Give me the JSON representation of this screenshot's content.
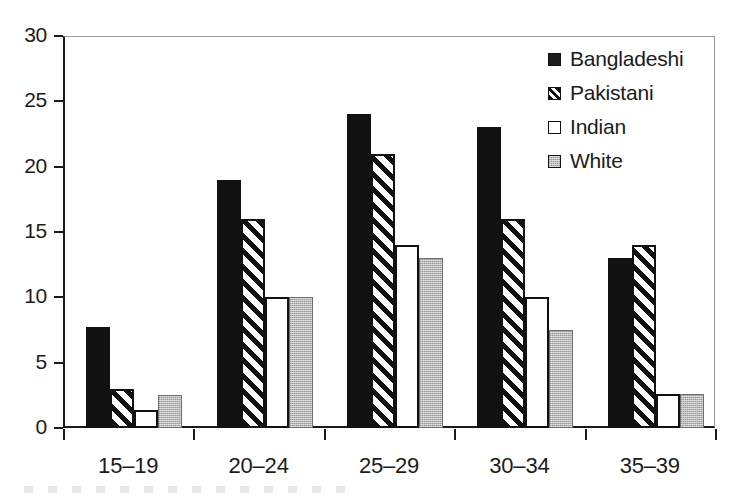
{
  "chart_data": {
    "type": "bar",
    "title": "",
    "subtitle": "",
    "xlabel": "",
    "ylabel": "",
    "categories": [
      "15–19",
      "20–24",
      "25–29",
      "30–34",
      "35–39"
    ],
    "series": [
      {
        "name": "Bangladeshi",
        "fill": "solid-black",
        "values": [
          7.7,
          19,
          24,
          23,
          13
        ]
      },
      {
        "name": "Pakistani",
        "fill": "diag-hatch",
        "values": [
          3.0,
          16,
          21,
          16,
          14
        ]
      },
      {
        "name": "Indian",
        "fill": "open-white",
        "values": [
          1.4,
          10,
          14,
          10,
          2.6
        ]
      },
      {
        "name": "White",
        "fill": "stipple-gray",
        "values": [
          2.5,
          10,
          13,
          7.5,
          2.6
        ]
      }
    ],
    "ylim": [
      0,
      30
    ],
    "ytick_values": [
      0,
      5,
      10,
      15,
      20,
      25,
      30
    ],
    "ytick_labels": [
      "0",
      "5",
      "10",
      "15",
      "20",
      "25",
      "30"
    ],
    "grid": false,
    "legend_position": "top-right-inside",
    "bar_orientation": "vertical",
    "group_gap": true,
    "annotations": []
  },
  "axes": {
    "y": {
      "ticks": [
        {
          "label": "30",
          "value": 30
        },
        {
          "label": "25",
          "value": 25
        },
        {
          "label": "20",
          "value": 20
        },
        {
          "label": "15",
          "value": 15
        },
        {
          "label": "10",
          "value": 10
        },
        {
          "label": "5",
          "value": 5
        },
        {
          "label": "0",
          "value": 0
        }
      ]
    },
    "x": {
      "ticks": [
        {
          "label": "15–19"
        },
        {
          "label": "20–24"
        },
        {
          "label": "25–29"
        },
        {
          "label": "30–34"
        },
        {
          "label": "35–39"
        }
      ]
    }
  },
  "legend": {
    "items": [
      {
        "label": "Bangladeshi",
        "swatch": "solid-black-swatch-icon"
      },
      {
        "label": "Pakistani",
        "swatch": "diagonal-hatch-swatch-icon"
      },
      {
        "label": "Indian",
        "swatch": "open-white-swatch-icon"
      },
      {
        "label": "White",
        "swatch": "stippled-gray-swatch-icon"
      }
    ]
  },
  "colors": {
    "bar_black": "#111111",
    "bar_white": "#ffffff",
    "bar_gray": "#b8b8b8",
    "axis": "#1b1b1b",
    "frame_light": "#9a9a9a",
    "background": "#ffffff",
    "text": "#1b1b1b"
  }
}
